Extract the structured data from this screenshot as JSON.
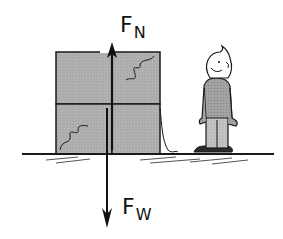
{
  "diagram": {
    "title": "",
    "scene": "A stack of four grey boxes resting on the ground with a cartoon person standing beside it",
    "forces": [
      {
        "id": "normal",
        "symbol": "F",
        "subscript": "N",
        "direction": "up",
        "meaning": "normal force"
      },
      {
        "id": "weight",
        "symbol": "F",
        "subscript": "W",
        "direction": "down",
        "meaning": "weight"
      }
    ],
    "colors": {
      "box_fill": "#a9a9a9",
      "outline": "#1a1a1a",
      "person_shirt": "#9a9a9a",
      "person_pants": "#bdbdbd",
      "background": "#ffffff"
    }
  }
}
